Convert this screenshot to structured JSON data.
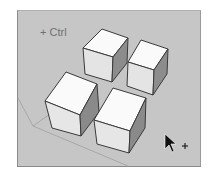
{
  "viewport": {
    "background_color": "#c6c6c6",
    "modifier_label": "+ Ctrl"
  },
  "scene": {
    "objects": [
      {
        "name": "cube-back-left"
      },
      {
        "name": "cube-back-right"
      },
      {
        "name": "cube-front-left"
      },
      {
        "name": "cube-front-right"
      }
    ],
    "cursor": {
      "icon": "arrow-cursor-with-plus-icon"
    }
  },
  "colors": {
    "top_face": "#fafafa",
    "left_face": "#e6e6e6",
    "right_face": "#8e8e8e",
    "edge": "#3a3a3a"
  }
}
